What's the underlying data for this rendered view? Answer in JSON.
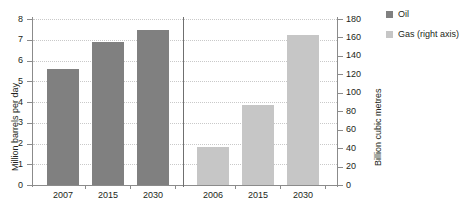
{
  "chart_data": {
    "type": "bar",
    "title": "",
    "subtitle": "",
    "panels": [
      {
        "name": "oil-panel",
        "series_name": "Oil",
        "categories": [
          "2007",
          "2015",
          "2030"
        ],
        "values": [
          5.6,
          6.9,
          7.45
        ],
        "axis": "left",
        "ylabel": "Million barrels per day",
        "ylim": [
          0,
          8
        ],
        "yticks": [
          "0",
          "1",
          "2",
          "3",
          "4",
          "5",
          "6",
          "7",
          "8"
        ],
        "color": "#808080"
      },
      {
        "name": "gas-panel",
        "series_name": "Gas (right axis)",
        "categories": [
          "2006",
          "2015",
          "2030"
        ],
        "values": [
          41,
          87,
          163
        ],
        "axis": "right",
        "ylabel": "Billion cubic metres",
        "ylim": [
          0,
          180
        ],
        "yticks": [
          "0",
          "20",
          "40",
          "60",
          "80",
          "100",
          "120",
          "140",
          "160",
          "180"
        ],
        "color": "#c6c6c6"
      }
    ],
    "xlabel": "",
    "grid": true,
    "legend_position": "top-right",
    "legend": [
      {
        "label": "Oil",
        "color": "#808080"
      },
      {
        "label": "Gas (right axis)",
        "color": "#c6c6c6"
      }
    ],
    "left_axis_title": "Million barrels per day",
    "right_axis_title": "Billion cubic metres"
  }
}
